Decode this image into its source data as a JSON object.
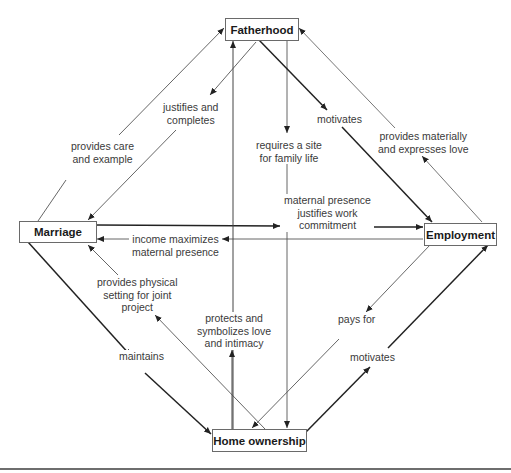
{
  "nodes": {
    "fatherhood": "Fatherhood",
    "marriage": "Marriage",
    "employment": "Employment",
    "home_ownership": "Home ownership"
  },
  "edges": [
    {
      "from": "Marriage",
      "to": "Fatherhood",
      "label": "provides care\nand example"
    },
    {
      "from": "Fatherhood",
      "to": "Marriage",
      "label": "justifies and\ncompletes"
    },
    {
      "from": "Fatherhood",
      "to": "Home ownership",
      "label": "requires a site\nfor family life"
    },
    {
      "from": "Fatherhood",
      "to": "Employment",
      "label": "motivates"
    },
    {
      "from": "Employment",
      "to": "Fatherhood",
      "label": "provides materially\nand expresses love"
    },
    {
      "from": "Marriage",
      "to": "Employment",
      "label": "maternal presence\njustifies work\ncommitment"
    },
    {
      "from": "Employment",
      "to": "Marriage",
      "label": "income maximizes\nmaternal presence"
    },
    {
      "from": "Home ownership",
      "to": "Marriage",
      "label": "provides physical\nsetting for joint\nproject"
    },
    {
      "from": "Home ownership",
      "to": "Fatherhood",
      "label": "protects and\nsymbolizes love\nand intimacy"
    },
    {
      "from": "Employment",
      "to": "Home ownership",
      "label": "pays for"
    },
    {
      "from": "Marriage",
      "to": "Home ownership",
      "label": "maintains"
    },
    {
      "from": "Home ownership",
      "to": "Employment",
      "label": "motivates"
    }
  ],
  "labels": {
    "provides_care": "provides care",
    "and_example": "and example",
    "justifies_and": "justifies and",
    "completes": "completes",
    "requires_site": "requires a site",
    "for_family_life": "for family life",
    "motivates_top": "motivates",
    "provides_materially": "provides materially",
    "and_expresses_love": "and expresses love",
    "maternal_presence": "maternal presence",
    "justifies_work": "justifies work",
    "commitment": "commitment",
    "income_maximizes": "income maximizes",
    "maternal_presence2": "maternal presence",
    "provides_physical": "provides physical",
    "setting_for_joint": "setting for joint",
    "project": "project",
    "protects_and": "protects and",
    "symbolizes_love": "symbolizes love",
    "and_intimacy": "and intimacy",
    "pays_for": "pays for",
    "maintains": "maintains",
    "motivates_bottom": "motivates"
  }
}
